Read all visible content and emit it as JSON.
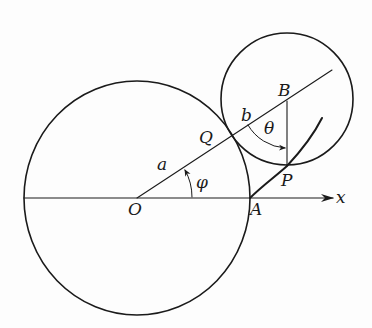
{
  "figure": {
    "labels": {
      "origin": "O",
      "point_a": "A",
      "point_b": "B",
      "point_q": "Q",
      "point_p": "P",
      "radius_a": "a",
      "radius_b": "b",
      "angle_phi": "φ",
      "angle_theta": "θ",
      "x_axis": "x"
    },
    "colors": {
      "ink": "#1a1a1a",
      "background": "#fdfdfd"
    }
  }
}
